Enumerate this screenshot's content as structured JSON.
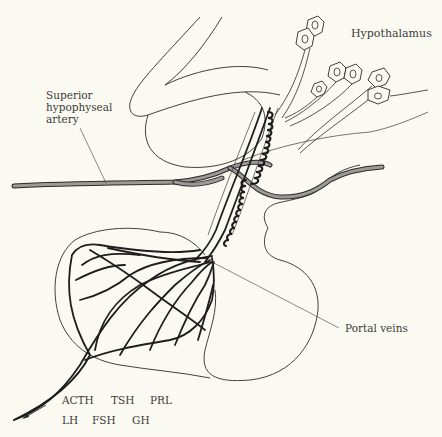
{
  "figure": {
    "background": "#fbfaf2",
    "line_color": "#2a2a2a",
    "artery_fill_color": "#9a9a96"
  },
  "labels": {
    "hypothalamus": "Hypothalamus",
    "superior_hypophyseal_artery_line1": "Superior",
    "superior_hypophyseal_artery_line2": "hypophyseal",
    "superior_hypophyseal_artery_line3": "artery",
    "portal_veins": "Portal veins"
  },
  "hormones": {
    "row1": [
      "ACTH",
      "TSH",
      "PRL"
    ],
    "row2": [
      "LH",
      "FSH",
      "GH"
    ]
  },
  "icons": {
    "outflow_arrow": "arrow-down-left"
  }
}
